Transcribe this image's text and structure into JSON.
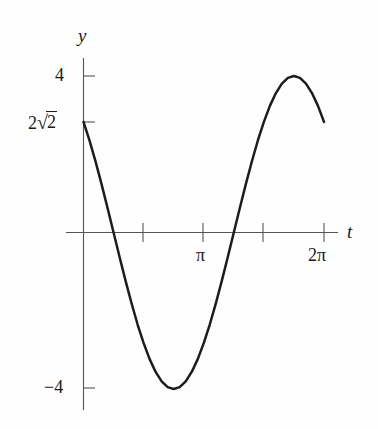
{
  "figure": {
    "background_color": "#fefefe",
    "curve_color": "#1c1c1c",
    "axis_color": "#555555"
  },
  "axes": {
    "x_axis_label": "t",
    "y_axis_label": "y",
    "x_ticks": [
      {
        "label": "",
        "value_pi": 0.5
      },
      {
        "label": "π",
        "value_pi": 1.0
      },
      {
        "label": "",
        "value_pi": 1.5
      },
      {
        "label": "2π",
        "value_pi": 2.0
      }
    ],
    "y_ticks": [
      {
        "label": "4",
        "value": 4
      },
      {
        "label": "2√2",
        "value": 2.828,
        "coefficient": "2",
        "radicand": "2"
      },
      {
        "label": "−4",
        "value": -4
      }
    ]
  },
  "chart_data": {
    "type": "line",
    "title": "",
    "xlabel": "t",
    "ylabel": "y",
    "xlim": [
      0,
      6.2832
    ],
    "ylim": [
      -4,
      4
    ],
    "grid": false,
    "legend": "none",
    "series": [
      {
        "name": "y = 4 sin(t + 3π/4)",
        "amplitude": 4,
        "phase_shift_pi": 0.75,
        "period_pi": 2,
        "x": [
          0.0,
          0.1571,
          0.3142,
          0.4712,
          0.6283,
          0.7854,
          0.9425,
          1.0996,
          1.2566,
          1.4137,
          1.5708,
          1.7279,
          1.885,
          2.042,
          2.1991,
          2.3562,
          2.5133,
          2.6704,
          2.8274,
          2.9845,
          3.1416,
          3.2987,
          3.4558,
          3.6128,
          3.7699,
          3.927,
          4.0841,
          4.2412,
          4.3982,
          4.5553,
          4.7124,
          4.8695,
          5.0265,
          5.1836,
          5.3407,
          5.4978,
          5.6549,
          5.8119,
          5.969,
          6.1261,
          6.2832
        ],
        "y": [
          2.828,
          2.352,
          1.816,
          1.236,
          0.625,
          0.0,
          -0.625,
          -1.236,
          -1.816,
          -2.352,
          -2.828,
          -3.236,
          -3.564,
          -3.804,
          -3.951,
          -4.0,
          -3.951,
          -3.804,
          -3.564,
          -3.236,
          -2.828,
          -2.352,
          -1.816,
          -1.236,
          -0.625,
          0.0,
          0.625,
          1.236,
          1.816,
          2.352,
          2.828,
          3.236,
          3.564,
          3.804,
          3.951,
          4.0,
          3.951,
          3.804,
          3.564,
          3.236,
          2.828
        ],
        "maximum": {
          "t_pi": 1.75,
          "y": 4
        },
        "minimum": {
          "t_pi": 0.75,
          "y": -4
        },
        "zero_crossings_pi": [
          0.25,
          1.25
        ],
        "start_point": {
          "t": 0,
          "y": 2.828
        },
        "end_point": {
          "t_pi": 2.0,
          "y": 2.828
        }
      }
    ]
  }
}
